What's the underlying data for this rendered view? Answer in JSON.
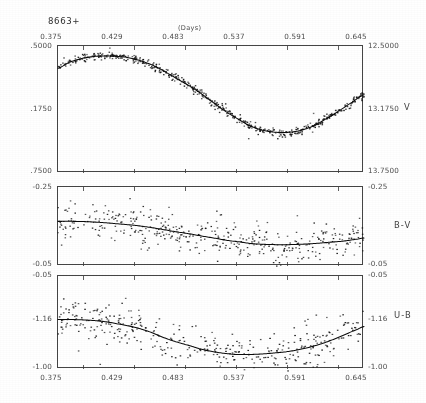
{
  "figure": {
    "object_label": "8663+",
    "x_axis_title": "(Days)",
    "x_ticks": [
      "0.375",
      "0.429",
      "0.483",
      "0.537",
      "0.591",
      "0.645"
    ],
    "x_range": [
      0.348,
      0.672
    ]
  },
  "panels": [
    {
      "series_label": "V",
      "left_ticks": [
        ".5000",
        ".1750",
        ".7500"
      ],
      "right_ticks": [
        "12.5000",
        "13.1750",
        "13.7500"
      ]
    },
    {
      "series_label": "B-V",
      "left_ticks": [
        "-0.25",
        "-0.05"
      ],
      "right_ticks": [
        "-0.25",
        "-0.05"
      ]
    },
    {
      "series_label": "U-B",
      "left_ticks": [
        "-0.05",
        "-1.16",
        "-1.00"
      ],
      "right_ticks": [
        "-0.05",
        "-1.16",
        "-1.00"
      ]
    }
  ],
  "chart_data": [
    {
      "type": "scatter",
      "title": "V",
      "xlabel": "(Days)",
      "ylabel": "V",
      "xlim": [
        0.348,
        0.672
      ],
      "ylim_left": [
        0.5,
        0.75
      ],
      "ylim_right": [
        12.5,
        13.75
      ],
      "y_inverted": false,
      "grid": false,
      "legend": "none",
      "note": "Magnitude light curve, dense sampling with low scatter; fitted smooth curve overlaid.",
      "fit_curve": {
        "x": [
          0.348,
          0.36,
          0.375,
          0.39,
          0.405,
          0.42,
          0.429,
          0.44,
          0.455,
          0.47,
          0.483,
          0.495,
          0.51,
          0.525,
          0.537,
          0.55,
          0.565,
          0.58,
          0.591,
          0.605,
          0.62,
          0.635,
          0.645,
          0.66,
          0.672
        ],
        "y": [
          12.72,
          12.66,
          12.62,
          12.6,
          12.6,
          12.61,
          12.63,
          12.66,
          12.72,
          12.8,
          12.87,
          12.94,
          13.04,
          13.14,
          13.21,
          13.28,
          13.33,
          13.35,
          13.35,
          13.33,
          13.28,
          13.2,
          13.14,
          13.05,
          12.98
        ]
      },
      "scatter_points_approx": 420,
      "scatter_spread_mag": 0.02
    },
    {
      "type": "scatter",
      "title": "B-V",
      "xlabel": "(Days)",
      "ylabel": "B-V",
      "xlim": [
        0.348,
        0.672
      ],
      "ylim": [
        -0.25,
        -0.05
      ],
      "y_inverted": false,
      "grid": false,
      "legend": "none",
      "note": "Colour index B-V versus phase; broad scatter with smooth fitted curve rising to a maximum near 0.57.",
      "fit_curve": {
        "x": [
          0.348,
          0.365,
          0.38,
          0.395,
          0.41,
          0.429,
          0.445,
          0.46,
          0.475,
          0.483,
          0.5,
          0.515,
          0.53,
          0.537,
          0.552,
          0.565,
          0.58,
          0.591,
          0.605,
          0.62,
          0.635,
          0.65,
          0.665,
          0.672
        ],
        "y": [
          -0.163,
          -0.163,
          -0.162,
          -0.16,
          -0.157,
          -0.153,
          -0.148,
          -0.142,
          -0.136,
          -0.133,
          -0.126,
          -0.12,
          -0.114,
          -0.112,
          -0.107,
          -0.105,
          -0.104,
          -0.104,
          -0.105,
          -0.107,
          -0.11,
          -0.113,
          -0.118,
          -0.121
        ]
      },
      "scatter_points_approx": 330,
      "scatter_spread_mag": 0.022
    },
    {
      "type": "scatter",
      "title": "U-B",
      "xlabel": "(Days)",
      "ylabel": "U-B",
      "xlim": [
        0.348,
        0.672
      ],
      "ylim": [
        -1.16,
        -1.0
      ],
      "y_inverted": false,
      "grid": false,
      "legend": "none",
      "note": "Colour index U-B versus phase; scatter larger than B-V, fitted curve peaks near 0.55 then declines.",
      "fit_curve": {
        "x": [
          0.348,
          0.365,
          0.38,
          0.395,
          0.41,
          0.429,
          0.445,
          0.46,
          0.475,
          0.483,
          0.5,
          0.515,
          0.53,
          0.537,
          0.552,
          0.565,
          0.58,
          0.591,
          0.605,
          0.62,
          0.635,
          0.65,
          0.665,
          0.672
        ],
        "y": [
          -1.085,
          -1.085,
          -1.084,
          -1.082,
          -1.078,
          -1.072,
          -1.064,
          -1.054,
          -1.046,
          -1.042,
          -1.034,
          -1.029,
          -1.026,
          -1.025,
          -1.025,
          -1.026,
          -1.028,
          -1.03,
          -1.034,
          -1.04,
          -1.048,
          -1.058,
          -1.068,
          -1.073
        ]
      },
      "scatter_points_approx": 300,
      "scatter_spread_mag": 0.018
    }
  ]
}
